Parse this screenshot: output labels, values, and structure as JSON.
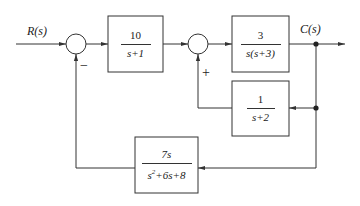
{
  "signals": {
    "input": "R(s)",
    "output": "C(s)"
  },
  "blocks": [
    {
      "id": "g1",
      "numerator": "10",
      "denominator": "s+1"
    },
    {
      "id": "g2",
      "numerator": "3",
      "denominator": "s(s+3)"
    },
    {
      "id": "h1",
      "numerator": "1",
      "denominator": "s+2"
    },
    {
      "id": "h2",
      "numerator": "7s",
      "denominator_base": "s",
      "denominator_exp": "2",
      "denominator_rest": "+6s+8"
    }
  ],
  "summers": [
    {
      "id": "sum1",
      "feedback_sign": "−"
    },
    {
      "id": "sum2",
      "feedback_sign": "+"
    }
  ],
  "colors": {
    "line": "#333333",
    "background": "#ffffff"
  }
}
